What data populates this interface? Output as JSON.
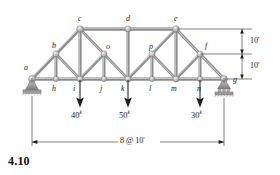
{
  "figure": {
    "number": "4.10",
    "kind": "truss-free-body-diagram",
    "background": "#ffffff",
    "member_color": "#9a9a9a",
    "outline_color": "#6e6e6e",
    "dimension_color": "#1b1b1b",
    "text_color": "#1b1b1b"
  },
  "joint_labels": {
    "a": "a",
    "b": "b",
    "c": "c",
    "d": "d",
    "e": "e",
    "f": "f",
    "g": "g",
    "h": "h",
    "i": "i",
    "j": "j",
    "k": "k",
    "l": "l",
    "m": "m",
    "n": "n",
    "o": "o",
    "p": "p"
  },
  "loads": [
    {
      "at_joint": "i",
      "label": "40",
      "unit": "k",
      "text": "40",
      "sup": "k",
      "direction": "down"
    },
    {
      "at_joint": "k",
      "label": "50",
      "unit": "k",
      "text": "50",
      "sup": "k",
      "direction": "down"
    },
    {
      "at_joint": "n",
      "label": "30",
      "unit": "k",
      "text": "30",
      "sup": "k",
      "direction": "down"
    }
  ],
  "dimensions": {
    "vertical_upper": "10'",
    "vertical_lower": "10'",
    "span": "8 @ 10'"
  },
  "supports": [
    {
      "at_joint": "a",
      "type": "pin",
      "name": "pin-support"
    },
    {
      "at_joint": "g",
      "type": "roller",
      "name": "roller-support"
    }
  ],
  "geometry": {
    "panel_spacing_ft": 10,
    "panels": 8,
    "height_ft": 20,
    "bottom_chord_joints": [
      "a",
      "h",
      "i",
      "j",
      "k",
      "l",
      "m",
      "n",
      "g"
    ],
    "top_chord_joints": [
      "c",
      "d",
      "e"
    ],
    "mid_joints": [
      "b",
      "o",
      "p",
      "f"
    ]
  }
}
